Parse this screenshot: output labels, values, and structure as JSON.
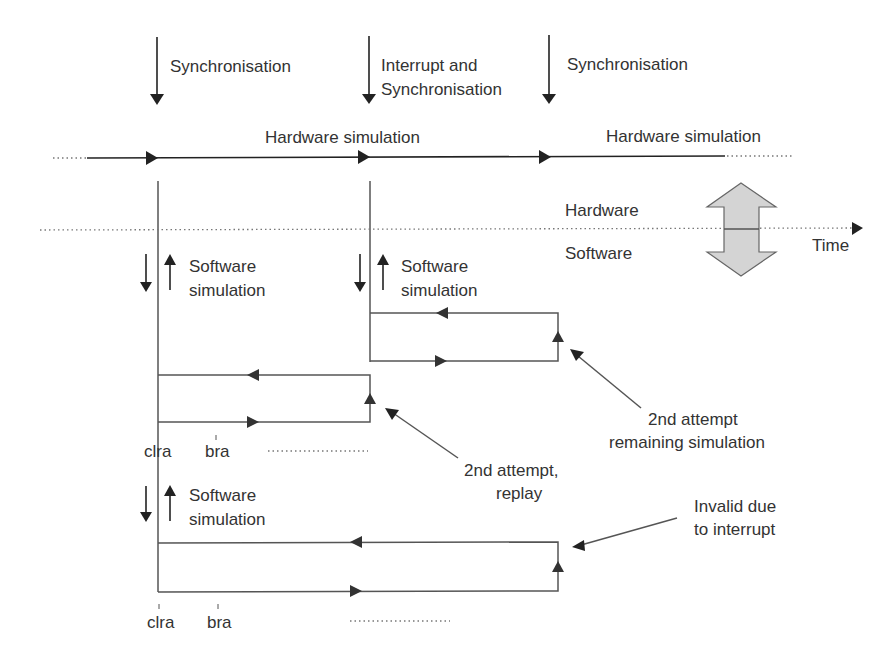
{
  "diagram": {
    "events": [
      {
        "label_lines": [
          "Synchronisation"
        ]
      },
      {
        "label_lines": [
          "Interrupt and",
          "Synchronisation"
        ]
      },
      {
        "label_lines": [
          "Synchronisation"
        ]
      }
    ],
    "hardware_simulation_labels": [
      "Hardware simulation",
      "Hardware simulation"
    ],
    "domain_divider": {
      "upper_label": "Hardware",
      "lower_label": "Software",
      "axis_label": "Time"
    },
    "software_simulation_blocks": [
      {
        "label_lines": [
          "Software",
          "simulation"
        ]
      },
      {
        "label_lines": [
          "Software",
          "simulation"
        ]
      },
      {
        "label_lines": [
          "Software",
          "simulation"
        ]
      }
    ],
    "instruction_markers": {
      "first_row": [
        "clra",
        "bra"
      ],
      "second_row": [
        "clra",
        "bra"
      ]
    },
    "annotations": {
      "remaining_simulation": [
        "2nd attempt",
        "remaining simulation"
      ],
      "replay": [
        "2nd attempt,",
        "replay"
      ],
      "invalid": [
        "Invalid due",
        "to interrupt"
      ]
    },
    "colors": {
      "line": "#555555",
      "arrow": "#222222",
      "double_arrow_fill": "#d4d4d4",
      "text": "#333333"
    }
  }
}
